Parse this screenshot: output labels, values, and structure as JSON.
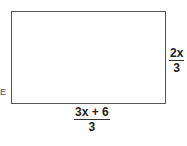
{
  "diagram": {
    "shape": "rectangle",
    "height_label": {
      "numerator": "2x",
      "denominator": "3"
    },
    "width_label": {
      "numerator": "3x + 6",
      "denominator": "3"
    },
    "left_edge_fragment": "E"
  }
}
